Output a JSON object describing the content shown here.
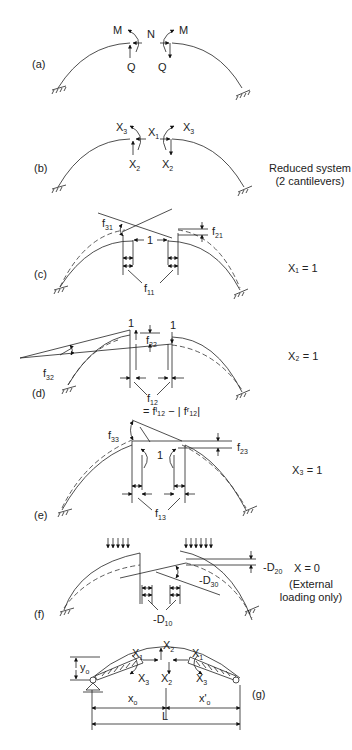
{
  "panels": [
    {
      "id": "a",
      "label": "(a)",
      "forces": [
        "M",
        "N",
        "Q"
      ]
    },
    {
      "id": "b",
      "label": "(b)",
      "forces": [
        "X",
        "X",
        "X"
      ],
      "note_line1": "Reduced system",
      "note_line2": "(2 cantilevers)"
    },
    {
      "id": "c",
      "label": "(c)",
      "condition": "X₁ = 1",
      "unit": "1",
      "coefficients": [
        "f31",
        "f21",
        "f11"
      ]
    },
    {
      "id": "d",
      "label": "(d)",
      "condition": "X₂ = 1",
      "unit": "1",
      "coefficients": [
        "f22",
        "f32",
        "f12"
      ],
      "equation": "= fˡ₁₂ − | fʳ₁₂|"
    },
    {
      "id": "e",
      "label": "(e)",
      "condition": "X₃ = 1",
      "unit": "1",
      "coefficients": [
        "f33",
        "f23",
        "f13"
      ]
    },
    {
      "id": "f",
      "label": "(f)",
      "condition": "X = 0",
      "note_line1": "(External",
      "note_line2": "loading only)",
      "coefficients": [
        "-D20",
        "-D30",
        "-D10"
      ]
    },
    {
      "id": "g",
      "label": "(g)",
      "dims": {
        "yo": "y",
        "xo": "x",
        "xpo": "x'",
        "L": "L"
      }
    }
  ],
  "text": {
    "M": "M",
    "N": "N",
    "Q": "Q",
    "X": "X",
    "s1": "1",
    "s2": "2",
    "s3": "3",
    "s0": "0",
    "s10": "10",
    "s11": "11",
    "s12": "12",
    "s13": "13",
    "s20": "20",
    "s21": "21",
    "s22": "22",
    "s23": "23",
    "s30": "30",
    "s31": "31",
    "s32": "32",
    "s33": "33",
    "f": "f",
    "D": "-D",
    "one": "1",
    "o": "o"
  }
}
